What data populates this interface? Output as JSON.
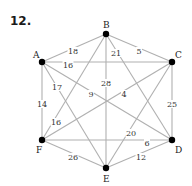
{
  "problem_number": "12.",
  "graph": {
    "nodes": [
      {
        "id": "A",
        "x": 42,
        "y": 62,
        "lx": 33,
        "ly": 58
      },
      {
        "id": "B",
        "x": 106,
        "y": 34,
        "lx": 103,
        "ly": 28
      },
      {
        "id": "C",
        "x": 172,
        "y": 62,
        "lx": 175,
        "ly": 58
      },
      {
        "id": "D",
        "x": 172,
        "y": 140,
        "lx": 175,
        "ly": 153
      },
      {
        "id": "E",
        "x": 106,
        "y": 168,
        "lx": 103,
        "ly": 182
      },
      {
        "id": "F",
        "x": 42,
        "y": 140,
        "lx": 36,
        "ly": 153
      }
    ],
    "edges": [
      {
        "from": "A",
        "to": "B",
        "weight": "18",
        "lx": 73,
        "ly": 51
      },
      {
        "from": "B",
        "to": "C",
        "weight": "5",
        "lx": 139,
        "ly": 51
      },
      {
        "from": "A",
        "to": "C",
        "weight": "16",
        "lx": 68,
        "ly": 65
      },
      {
        "from": "A",
        "to": "F",
        "weight": "14",
        "lx": 42,
        "ly": 104
      },
      {
        "from": "C",
        "to": "D",
        "weight": "25",
        "lx": 172,
        "ly": 104
      },
      {
        "from": "F",
        "to": "E",
        "weight": "26",
        "lx": 73,
        "ly": 157
      },
      {
        "from": "E",
        "to": "D",
        "weight": "12",
        "lx": 141,
        "ly": 157
      },
      {
        "from": "F",
        "to": "D",
        "weight": "6",
        "lx": 147,
        "ly": 143
      },
      {
        "from": "B",
        "to": "E",
        "weight": "28",
        "lx": 106,
        "ly": 83
      },
      {
        "from": "B",
        "to": "F",
        "weight": "16",
        "lx": 56,
        "ly": 122
      },
      {
        "from": "B",
        "to": "D",
        "weight": "21",
        "lx": 116,
        "ly": 53
      },
      {
        "from": "A",
        "to": "E",
        "weight": "17",
        "lx": 57,
        "ly": 87
      },
      {
        "from": "A",
        "to": "D",
        "weight": "9",
        "lx": 91,
        "ly": 94
      },
      {
        "from": "F",
        "to": "C",
        "weight": "4",
        "lx": 124,
        "ly": 94
      },
      {
        "from": "E",
        "to": "C",
        "weight": "20",
        "lx": 131,
        "ly": 133
      }
    ]
  }
}
